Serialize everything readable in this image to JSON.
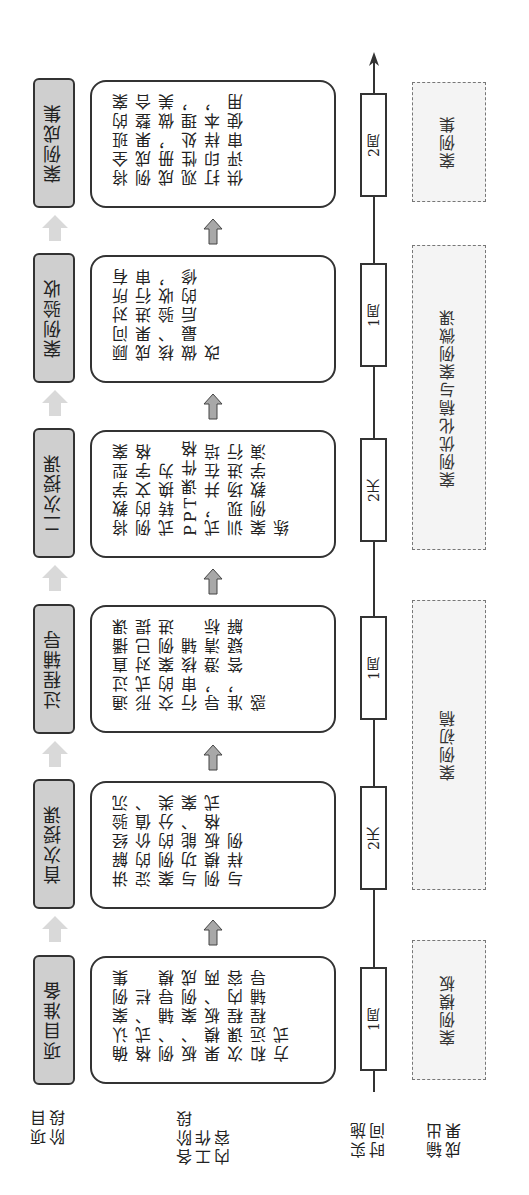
{
  "row_labels": {
    "stage": "项目\n阶段",
    "work": "各阶段\n工作\n内容",
    "time": "实施\n时间",
    "output": "输出\n成果"
  },
  "stages": [
    {
      "label": "项目准备",
      "content": "确认案例集格式、栏例、辅导模板、案例成果模板、两次课程内容和远程辅导方式",
      "content_lines": [
        "确认案例集",
        "格式、栏例、",
        "辅导模板、",
        "案例成果模",
        "板、两次课",
        "程内容和远",
        "程辅导方式"
      ],
      "time": "1周"
    },
    {
      "label": "首次授课",
      "content": "讲解经验沉淀的价值、案例的分类与功能、案例模板格式与样例",
      "content_lines": [
        "讲解经验沉",
        "淀的价值、",
        "案例的分类",
        "与功能、案",
        "例模板格式",
        "与样例"
      ],
      "time": "2天"
    },
    {
      "label": "过程辅导",
      "content": "通过直播课形式对已提交的案例进行审核辅导，澄清标准，答疑解惑",
      "content_lines": [
        "通过直播课",
        "形式对已提",
        "交的案例进",
        "行审核辅导，",
        "澄清标准，",
        "答疑解惑"
      ],
      "time": "1周"
    },
    {
      "label": "二次授课",
      "content": "将教学型案例的文字格式转换为PPT课件格式，并在培训现场进行案例教学演练",
      "content_lines": [
        "将教学型案",
        "例的文字格",
        "式转换为PPT",
        "课件格式，",
        "并在培训现",
        "场进行案例",
        "教学演练"
      ],
      "time": "2天"
    },
    {
      "label": "案例验收",
      "content": "顾问对所有成果进行审核、验收，做最后的修改",
      "content_lines": [
        "顾问对所有",
        "成果进行审",
        "核、验收，做",
        "最后的修改"
      ],
      "time": "1周"
    },
    {
      "label": "案例成集",
      "content": "将全班的案例成果整合成册，做美观性处理，打印样本，供评审使用",
      "content_lines": [
        "将全班的案",
        "例成果整合",
        "成册，做美",
        "观性处理，",
        "打印样本，",
        "供评审使用"
      ],
      "time": "2周"
    }
  ],
  "outputs": [
    {
      "label": "案例模板"
    },
    {
      "label": "案例初稿"
    },
    {
      "label": "案例优化稿与案例微课"
    },
    {
      "label": "案例集"
    }
  ],
  "colors": {
    "stage_fill": "#cfcfcf",
    "border": "#333333",
    "output_fill": "#f4f4f4",
    "arrow_light": "#d9d9d9",
    "arrow_dark": "#a8a8a8"
  }
}
